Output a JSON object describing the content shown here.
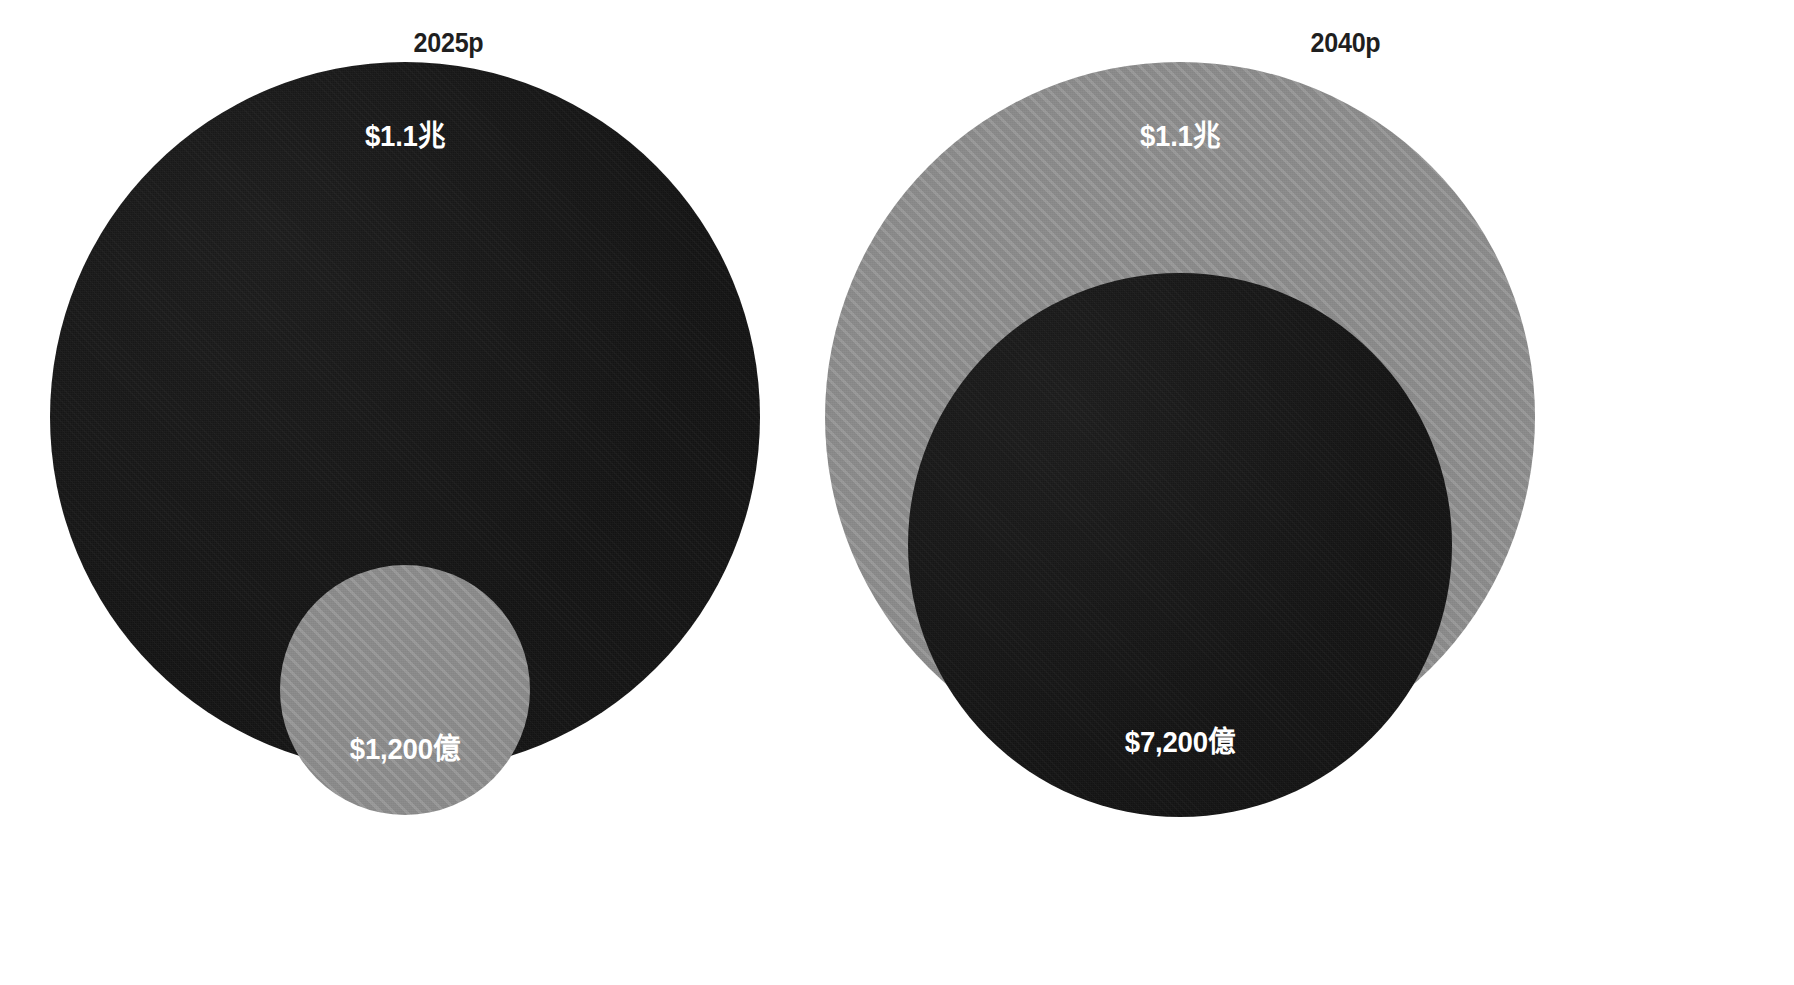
{
  "chart_data": {
    "type": "bubble",
    "title": "",
    "subtitle": "",
    "xlabel": "",
    "ylabel": "",
    "legend_position": "none",
    "grid": false,
    "note": "Two nested-bubble panels comparing a total market value against a sub-segment value for two forecast years.",
    "panels": [
      {
        "id": "panel-2025p",
        "title": "2025p",
        "bubbles": [
          {
            "id": "total-2025",
            "label": "$1.1兆",
            "value": 1100000000000,
            "value_display": "$1.1兆",
            "style": "dark",
            "color": "#151515",
            "radius_px": 355,
            "center_px": [
              405,
              417
            ],
            "label_pos_px": [
              405,
              130
            ]
          },
          {
            "id": "segment-2025",
            "label": "$1,200億",
            "value": 120000000000,
            "value_display": "$1,200億",
            "style": "gray-hatched",
            "color": "#8b8b8b",
            "radius_px": 125,
            "center_px": [
              405,
              690
            ],
            "label_pos_px": [
              405,
              743
            ]
          }
        ]
      },
      {
        "id": "panel-2040p",
        "title": "2040p",
        "bubbles": [
          {
            "id": "total-2040",
            "label": "$1.1兆",
            "value": 1100000000000,
            "value_display": "$1.1兆",
            "style": "gray-hatched",
            "color": "#8b8b8b",
            "radius_px": 355,
            "center_px": [
              1180,
              417
            ],
            "label_pos_px": [
              1180,
              130
            ]
          },
          {
            "id": "segment-2040",
            "label": "$7,200億",
            "value": 720000000000,
            "value_display": "$7,200億",
            "style": "dark",
            "color": "#151515",
            "radius_px": 272,
            "center_px": [
              1180,
              545
            ],
            "label_pos_px": [
              1180,
              736
            ]
          }
        ]
      }
    ],
    "colors": {
      "dark_bubble": "#151515",
      "gray_bubble": "#8b8b8b",
      "label_text": "#ffffff",
      "title_text": "#1f1f1f",
      "background": "#ffffff"
    }
  },
  "panels": {
    "left": {
      "title": "2025p",
      "outer_label": "$1.1兆",
      "inner_label": "$1,200億"
    },
    "right": {
      "title": "2040p",
      "outer_label": "$1.1兆",
      "inner_label": "$7,200億"
    }
  }
}
